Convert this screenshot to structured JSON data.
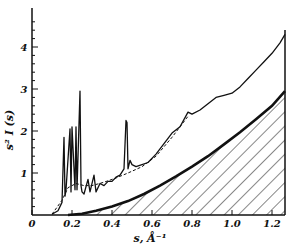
{
  "chart_data": {
    "type": "line",
    "title": "",
    "xlabel": "s, Å⁻¹",
    "ylabel": "s² I (s)",
    "xlim": [
      0,
      1.265
    ],
    "ylim": [
      0,
      4.8
    ],
    "x_ticks": [
      "0",
      "0.2",
      "0.4",
      "0.6",
      "0.8",
      "1.0",
      "1.2"
    ],
    "y_ticks": [
      "1",
      "2",
      "3",
      "4"
    ],
    "grid": false,
    "legend": null,
    "series": [
      {
        "name": "experimental s²I(s) (upper trace with sharp peaks)",
        "style": "solid thin",
        "x": [
          0.1,
          0.13,
          0.15,
          0.16,
          0.165,
          0.17,
          0.19,
          0.195,
          0.2,
          0.215,
          0.22,
          0.225,
          0.24,
          0.245,
          0.25,
          0.26,
          0.28,
          0.29,
          0.31,
          0.32,
          0.34,
          0.36,
          0.38,
          0.4,
          0.42,
          0.44,
          0.46,
          0.47,
          0.475,
          0.48,
          0.49,
          0.5,
          0.52,
          0.55,
          0.58,
          0.62,
          0.66,
          0.7,
          0.74,
          0.78,
          0.8,
          0.84,
          0.88,
          0.92,
          0.96,
          1.0,
          1.04,
          1.08,
          1.12,
          1.16,
          1.2,
          1.24,
          1.265
        ],
        "y": [
          0.02,
          0.1,
          0.3,
          1.85,
          0.45,
          0.6,
          2.05,
          0.55,
          2.1,
          0.6,
          2.1,
          0.6,
          2.95,
          0.7,
          0.55,
          0.5,
          0.85,
          0.55,
          0.95,
          0.55,
          0.75,
          0.7,
          0.8,
          0.8,
          0.9,
          0.95,
          1.1,
          2.25,
          2.2,
          1.1,
          1.3,
          1.2,
          1.15,
          1.2,
          1.25,
          1.45,
          1.7,
          1.95,
          2.1,
          2.45,
          2.4,
          2.5,
          2.65,
          2.8,
          2.85,
          2.9,
          3.05,
          3.25,
          3.45,
          3.65,
          3.85,
          4.1,
          4.3
        ]
      },
      {
        "name": "smooth background (dashed envelope)",
        "style": "dashed",
        "x": [
          0.1,
          0.15,
          0.18,
          0.22,
          0.26,
          0.3,
          0.36,
          0.42,
          0.48,
          0.55,
          0.62,
          0.7,
          0.78
        ],
        "y": [
          0.02,
          0.35,
          0.65,
          0.75,
          0.7,
          0.7,
          0.78,
          0.88,
          1.0,
          1.15,
          1.4,
          1.85,
          2.35
        ]
      },
      {
        "name": "theoretical atomic background (thick, hatched below)",
        "style": "solid thick, hatched fill",
        "x": [
          0.18,
          0.25,
          0.32,
          0.4,
          0.48,
          0.56,
          0.64,
          0.72,
          0.8,
          0.88,
          0.96,
          1.04,
          1.12,
          1.2,
          1.265
        ],
        "y": [
          0.0,
          0.03,
          0.1,
          0.2,
          0.33,
          0.5,
          0.7,
          0.92,
          1.15,
          1.4,
          1.68,
          1.97,
          2.28,
          2.6,
          2.95
        ]
      }
    ],
    "annotations": [
      "hatched area under thick curve"
    ]
  }
}
